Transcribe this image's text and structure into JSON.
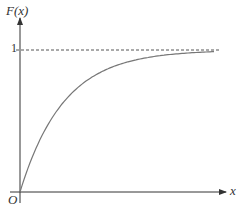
{
  "chart_data": {
    "type": "line",
    "title": "",
    "function": "F(x) = 1 - e^(-λx)",
    "xlabel": "x",
    "ylabel": "F(x)",
    "origin_label": "O",
    "yticks": [
      {
        "value": 1,
        "label": "1"
      }
    ],
    "asymptote": {
      "y": 1,
      "style": "dashed"
    },
    "xlim": [
      0,
      9
    ],
    "ylim": [
      0,
      1.1
    ],
    "grid": false,
    "legend": null,
    "series": [
      {
        "name": "F(x)",
        "x": [
          0,
          1,
          2,
          3,
          4,
          5,
          6,
          7,
          8
        ],
        "values": [
          0,
          0.44,
          0.69,
          0.83,
          0.9,
          0.94,
          0.97,
          0.98,
          0.99
        ]
      }
    ]
  },
  "colors": {
    "axis": "#333333",
    "curve": "#777777",
    "dash": "#555555"
  }
}
